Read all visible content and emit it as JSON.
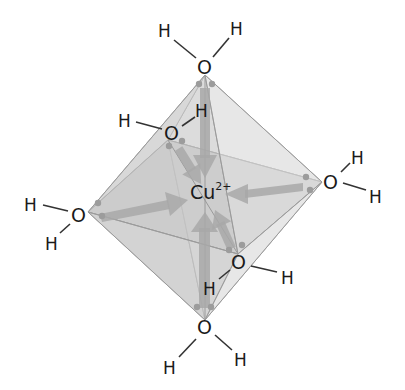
{
  "diagram": {
    "center": {
      "symbol": "Cu",
      "charge": "2+"
    },
    "ligands": [
      {
        "id": "top",
        "oxygen": "O",
        "h1": "H",
        "h2": "H"
      },
      {
        "id": "back-upper",
        "oxygen": "O",
        "h1": "H",
        "h2": "H"
      },
      {
        "id": "left",
        "oxygen": "O",
        "h1": "H",
        "h2": "H"
      },
      {
        "id": "right",
        "oxygen": "O",
        "h1": "H",
        "h2": "H"
      },
      {
        "id": "front-lower",
        "oxygen": "O",
        "h1": "H",
        "h2": "H"
      },
      {
        "id": "bottom",
        "oxygen": "O",
        "h1": "H",
        "h2": "H"
      }
    ],
    "colors": {
      "background": "#ffffff",
      "face_light": "#e4e4e4",
      "face_mid": "#d2d2d2",
      "face_dark": "#c4c4c4",
      "arrow": "#a8a8a8",
      "text": "#1a1a1a"
    },
    "geometry": "octahedral",
    "coordination_number": 6
  }
}
